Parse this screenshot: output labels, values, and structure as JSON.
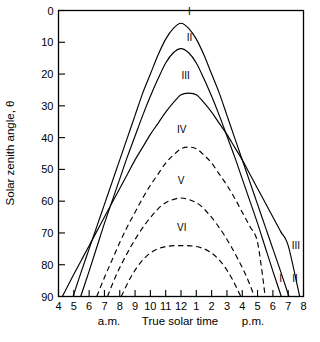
{
  "chart_data": {
    "type": "line",
    "title": "",
    "xlabel": "True solar time",
    "ylabel": "Solar zenith angle, θ",
    "xlim": [
      4,
      20
    ],
    "ylim": [
      90,
      0
    ],
    "y_inverted": true,
    "grid": false,
    "legend": "inline-curve-labels",
    "x_tick_values": [
      4,
      5,
      6,
      7,
      8,
      9,
      10,
      11,
      12,
      13,
      14,
      15,
      16,
      17,
      18,
      19,
      20
    ],
    "x_tick_labels": [
      "4",
      "5",
      "6",
      "7",
      "8",
      "9",
      "10",
      "11",
      "12",
      "1",
      "2",
      "3",
      "4",
      "5",
      "6",
      "7",
      "8"
    ],
    "y_tick_labels": [
      "0",
      "10",
      "20",
      "30",
      "40",
      "50",
      "60",
      "70",
      "80",
      "90"
    ],
    "y_tick_values": [
      0,
      10,
      20,
      30,
      40,
      50,
      60,
      70,
      80,
      90
    ],
    "am_label": "a.m.",
    "pm_label": "p.m.",
    "series": [
      {
        "name": "I",
        "style": "solid",
        "peak_zenith_deg": 4,
        "sunrise_hour": 4.95,
        "sunset_hour": 19.05,
        "x": [
          4.95,
          5.5,
          6,
          6.5,
          7,
          7.5,
          8,
          8.5,
          9,
          9.5,
          10,
          10.5,
          11,
          11.5,
          12,
          12.5,
          13,
          13.5,
          14,
          14.5,
          15,
          15.5,
          16,
          16.5,
          17,
          17.5,
          18,
          18.5,
          19.05
        ],
        "values": [
          90,
          82,
          75,
          68,
          61,
          54,
          47,
          40,
          33,
          26,
          20,
          14,
          9,
          5.6,
          4,
          5.6,
          9,
          14,
          20,
          26,
          33,
          40,
          47,
          54,
          61,
          68,
          75,
          82,
          90
        ]
      },
      {
        "name": "II",
        "style": "solid",
        "peak_zenith_deg": 12,
        "sunrise_hour": 5.45,
        "sunset_hour": 18.55,
        "x": [
          5.45,
          6,
          6.5,
          7,
          7.5,
          8,
          8.5,
          9,
          9.5,
          10,
          10.5,
          11,
          11.5,
          12,
          12.5,
          13,
          13.5,
          14,
          14.5,
          15,
          15.5,
          16,
          16.5,
          17,
          17.5,
          18,
          18.55
        ],
        "values": [
          90,
          82,
          74.5,
          67,
          60,
          53,
          46,
          39.5,
          33,
          27,
          21.5,
          16.5,
          13.3,
          12,
          13.3,
          16.5,
          21.5,
          27,
          33,
          39.5,
          46,
          53,
          60,
          67,
          74.5,
          82,
          90
        ]
      },
      {
        "name": "III",
        "style": "solid",
        "peak_zenith_deg": 26,
        "sunrise_hour": 4.25,
        "sunset_hour": 19.75,
        "x": [
          4.25,
          5,
          5.5,
          6,
          6.5,
          7,
          7.5,
          8,
          8.5,
          9,
          9.5,
          10,
          10.5,
          11,
          11.5,
          12,
          12.5,
          13,
          13.5,
          14,
          14.5,
          15,
          15.5,
          16,
          16.5,
          17,
          17.5,
          18,
          18.5,
          19,
          19.75
        ],
        "values": [
          90,
          83,
          78.5,
          74,
          69.5,
          65,
          60.5,
          56,
          51.5,
          47,
          43,
          39,
          35.5,
          32,
          29,
          26.5,
          26,
          26.5,
          29,
          32,
          35.5,
          39,
          43,
          47,
          51.5,
          56,
          60.5,
          65,
          69.5,
          74,
          90
        ]
      },
      {
        "name": "IV",
        "style": "dashed",
        "peak_zenith_deg": 43,
        "sunrise_hour": 6.5,
        "sunset_hour": 17.5,
        "x": [
          6.5,
          7,
          7.5,
          8,
          8.5,
          9,
          9.5,
          10,
          10.5,
          11,
          11.5,
          12,
          12.5,
          13,
          13.5,
          14,
          14.5,
          15,
          15.5,
          16,
          16.5,
          17,
          17.5
        ],
        "values": [
          90,
          84,
          78.5,
          73,
          68,
          63.5,
          59,
          55,
          51.5,
          48,
          45.5,
          43.5,
          43,
          43.5,
          45.5,
          48,
          51.5,
          55,
          59,
          63.5,
          68,
          73,
          90
        ]
      },
      {
        "name": "V",
        "style": "dashed",
        "peak_zenith_deg": 59,
        "sunrise_hour": 7.2,
        "sunset_hour": 16.8,
        "x": [
          7.2,
          7.7,
          8.2,
          8.7,
          9.2,
          9.7,
          10.2,
          10.7,
          11.2,
          11.7,
          12,
          12.3,
          12.8,
          13.3,
          13.8,
          14.3,
          14.8,
          15.3,
          15.8,
          16.3,
          16.8
        ],
        "values": [
          90,
          84,
          79,
          74.5,
          70.5,
          67,
          64,
          61.5,
          60,
          59.2,
          59,
          59.2,
          60,
          61.5,
          64,
          67,
          70.5,
          74.5,
          79,
          84,
          90
        ]
      },
      {
        "name": "VI",
        "style": "dashed",
        "peak_zenith_deg": 74,
        "sunrise_hour": 8.1,
        "sunset_hour": 15.9,
        "x": [
          8.1,
          8.6,
          9.1,
          9.6,
          10.1,
          10.6,
          11.1,
          11.6,
          12,
          12.4,
          12.9,
          13.4,
          13.9,
          14.4,
          14.9,
          15.4,
          15.9
        ],
        "values": [
          90,
          85,
          81,
          78,
          76,
          74.8,
          74.2,
          74,
          74,
          74,
          74.2,
          74.8,
          76,
          78,
          81,
          85,
          90
        ]
      }
    ],
    "inline_labels": [
      {
        "text": "I",
        "x": 12.55,
        "y": 1.5
      },
      {
        "text": "II",
        "x": 12.55,
        "y": 9.5
      },
      {
        "text": "III",
        "x": 12.3,
        "y": 21.5
      },
      {
        "text": "IV",
        "x": 12.05,
        "y": 38.5
      },
      {
        "text": "V",
        "x": 12.0,
        "y": 54.5
      },
      {
        "text": "VI",
        "x": 12.05,
        "y": 69.5
      },
      {
        "text": "III",
        "x": 19.5,
        "y": 75
      },
      {
        "text": "I",
        "x": 18.5,
        "y": 85.5
      },
      {
        "text": "II",
        "x": 19.45,
        "y": 85.5
      }
    ]
  }
}
